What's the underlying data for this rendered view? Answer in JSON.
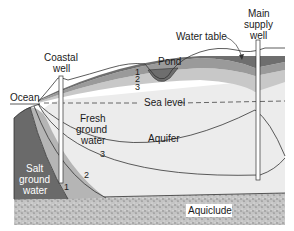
{
  "diagram": {
    "type": "cross-section",
    "labels": {
      "coastal_well": [
        "Coastal",
        "well"
      ],
      "main_supply_well": [
        "Main",
        "supply",
        "well"
      ],
      "water_table": "Water table",
      "pond": "Pond",
      "ocean": "Ocean",
      "sea_level": "Sea level",
      "fresh_ground_water": [
        "Fresh",
        "ground",
        "water"
      ],
      "aquifer": "Aquifer",
      "salt_ground_water": [
        "Salt",
        "ground",
        "water"
      ],
      "aquiclude": "Aquiclude"
    },
    "stage_numbers": {
      "top_1": "1",
      "top_2": "2",
      "top_3": "3",
      "interface_1": "1",
      "interface_2": "2",
      "interface_3": "3"
    },
    "colors": {
      "layer_1": "#6e6e6e",
      "layer_2": "#9a9a9a",
      "layer_3": "#c8c8c8",
      "fresh_water": "#ececec",
      "salt_water": "#6a6a6a",
      "aquiclude": "#bdbdbd"
    }
  }
}
